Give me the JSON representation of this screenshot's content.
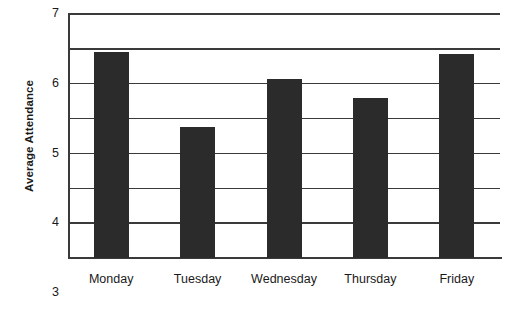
{
  "chart_data": {
    "type": "bar",
    "title": "",
    "xlabel": "",
    "ylabel": "Average Attendance",
    "categories": [
      "Monday",
      "Tuesday",
      "Wednesday",
      "Thursday",
      "Friday"
    ],
    "values": [
      5.9,
      3.75,
      5.15,
      4.6,
      5.85
    ],
    "ylim": [
      0,
      7
    ],
    "ytick_labels": [
      "7",
      "6",
      "5",
      "4",
      "3",
      "2",
      "1",
      "0"
    ],
    "ytick_values": [
      7,
      6,
      5,
      4,
      3,
      2,
      1,
      0
    ],
    "grid": true,
    "grid_axis": "y",
    "legend": null,
    "bar_color": "#2b2b2b",
    "axis_color": "#3a3a3a",
    "background_color": "#ffffff"
  },
  "axis": {
    "y_title": "Average Attendance",
    "ticks": [
      {
        "label": "7",
        "value": 7
      },
      {
        "label": "6",
        "value": 6
      },
      {
        "label": "5",
        "value": 5
      },
      {
        "label": "4",
        "value": 4
      },
      {
        "label": "3",
        "value": 3
      },
      {
        "label": "2",
        "value": 2
      },
      {
        "label": "1",
        "value": 1
      },
      {
        "label": "0",
        "value": 0
      }
    ]
  },
  "bars": [
    {
      "label": "Monday",
      "value": 5.9
    },
    {
      "label": "Tuesday",
      "value": 3.75
    },
    {
      "label": "Wednesday",
      "value": 5.15
    },
    {
      "label": "Thursday",
      "value": 4.6
    },
    {
      "label": "Friday",
      "value": 5.85
    }
  ]
}
